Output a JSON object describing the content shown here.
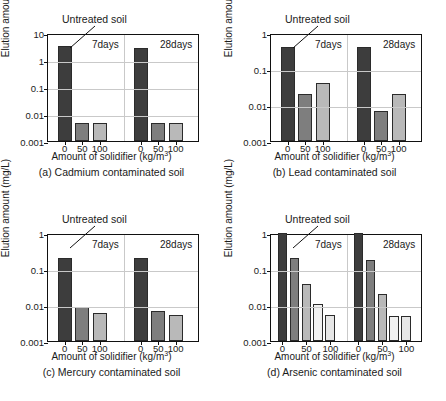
{
  "figure": {
    "shared": {
      "xlabel_text": "Amount of solidifier (kg/m",
      "xlabel_sup": "3",
      "xlabel_tail": ")",
      "ylabel": "Elution amount (mg/L)",
      "annotation": "Untreated soil",
      "group_labels": [
        "7days",
        "28days"
      ]
    },
    "panels": [
      {
        "id": "panel-a",
        "caption": "(a) Cadmium contaminated soil",
        "chart_data": {
          "type": "bar",
          "title": "(a) Cadmium contaminated soil",
          "xlabel": "Amount of solidifier (kg/m3)",
          "ylabel": "Elution amount (mg/L)",
          "yscale": "log",
          "ylim": [
            0.001,
            10
          ],
          "yticks": [
            "10",
            "1",
            "0.1",
            "0.01",
            "0.001"
          ],
          "ytick_values": [
            10,
            1,
            0.1,
            0.01,
            0.001
          ],
          "grid": true,
          "categories": [
            "0",
            "50",
            "100"
          ],
          "groups": [
            "7days",
            "28days"
          ],
          "annotations": [
            "Untreated soil"
          ],
          "series": [
            {
              "name": "7days",
              "values": [
                3.2,
                0.0046,
                0.0047
              ]
            },
            {
              "name": "28days",
              "values": [
                2.9,
                0.0045,
                0.0047
              ]
            }
          ]
        }
      },
      {
        "id": "panel-b",
        "caption": "(b) Lead contaminated soil",
        "chart_data": {
          "type": "bar",
          "title": "(b) Lead contaminated soil",
          "xlabel": "Amount of solidifier (kg/m3)",
          "ylabel": "Elution amount (mg/L)",
          "yscale": "log",
          "ylim": [
            0.001,
            1
          ],
          "yticks": [
            "1",
            "0.1",
            "0.01",
            "0.001"
          ],
          "ytick_values": [
            1,
            0.1,
            0.01,
            0.001
          ],
          "grid": true,
          "categories": [
            "0",
            "50",
            "100"
          ],
          "groups": [
            "7days",
            "28days"
          ],
          "annotations": [
            "Untreated soil"
          ],
          "series": [
            {
              "name": "7days",
              "values": [
                0.42,
                0.02,
                0.04
              ]
            },
            {
              "name": "28days",
              "values": [
                0.42,
                0.007,
                0.02
              ]
            }
          ]
        }
      },
      {
        "id": "panel-c",
        "caption": "(c) Mercury contaminated soil",
        "chart_data": {
          "type": "bar",
          "title": "(c) Mercury contaminated soil",
          "xlabel": "Amount of solidifier (kg/m3)",
          "ylabel": "Elution amount (mg/L)",
          "yscale": "log",
          "ylim": [
            0.001,
            1
          ],
          "yticks": [
            "1",
            "0.1",
            "0.01",
            "0.001"
          ],
          "ytick_values": [
            1,
            0.1,
            0.01,
            0.001
          ],
          "grid": true,
          "categories": [
            "0",
            "50",
            "100"
          ],
          "groups": [
            "7days",
            "28days"
          ],
          "annotations": [
            "Untreated soil"
          ],
          "series": [
            {
              "name": "7days",
              "values": [
                0.2,
                0.009,
                0.006
              ]
            },
            {
              "name": "28days",
              "values": [
                0.2,
                0.0068,
                0.0052
              ]
            }
          ]
        }
      },
      {
        "id": "panel-d",
        "caption": "(d) Arsenic contaminated soil",
        "chart_data": {
          "type": "bar",
          "title": "(d) Arsenic contaminated soil",
          "xlabel": "Amount of solidifier (kg/m3)",
          "ylabel": "Elution amount (mg/L)",
          "yscale": "log",
          "ylim": [
            0.001,
            1
          ],
          "yticks": [
            "1",
            "0.1",
            "0.01",
            "0.001"
          ],
          "ytick_values": [
            1,
            0.1,
            0.01,
            0.001
          ],
          "grid": true,
          "categories": [
            "0",
            "",
            "50",
            "",
            "100"
          ],
          "groups": [
            "7days",
            "28days"
          ],
          "annotations": [
            "Untreated soil"
          ],
          "bars_per_group": 5,
          "series": [
            {
              "name": "7days",
              "values": [
                1.0,
                0.2,
                0.038,
                0.0105,
                0.0053
              ]
            },
            {
              "name": "28days",
              "values": [
                1.0,
                0.18,
                0.02,
                0.005,
                0.005
              ]
            }
          ]
        }
      }
    ]
  },
  "colors": {
    "bar_dark": "#3d3d3d",
    "bar_medium": "#7e7e7e",
    "bar_light": "#b9b9b9",
    "bar_pale": "#e6e6e6",
    "bar_palest": "#f1f1f1",
    "axis": "#111111",
    "grid": "#c9c9c9",
    "background": "#ffffff"
  }
}
